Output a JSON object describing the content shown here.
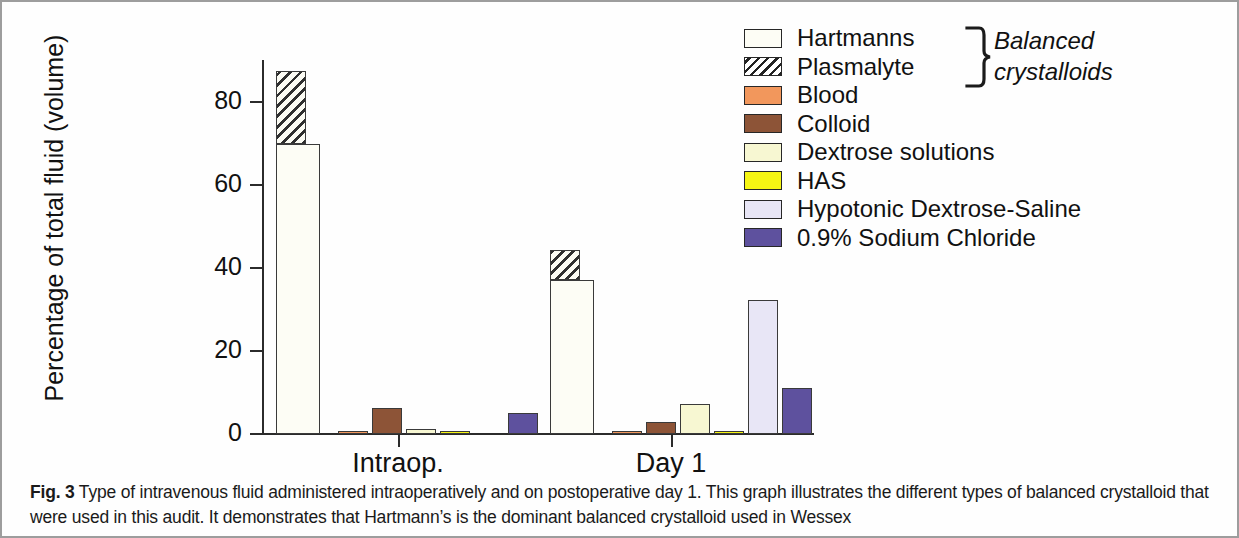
{
  "figure": {
    "caption_label": "Fig. 3",
    "caption_text": "Type of intravenous fluid administered intraoperatively and on postoperative day 1. This graph illustrates the different types of balanced crystalloid that were used in this audit. It demonstrates that Hartmann’s is the dominant balanced crystalloid used in Wessex"
  },
  "legend": {
    "annotation": "Balanced\ncrystalloids",
    "annotation_line1": "Balanced",
    "annotation_line2": "crystalloids",
    "items": [
      {
        "label": "Hartmanns",
        "color": "#fdfdf5",
        "pattern": "solid"
      },
      {
        "label": "Plasmalyte",
        "color": "#ffffff",
        "pattern": "hatch"
      },
      {
        "label": "Blood",
        "color": "#f2975c",
        "pattern": "solid"
      },
      {
        "label": "Colloid",
        "color": "#8d5437",
        "pattern": "solid"
      },
      {
        "label": "Dextrose solutions",
        "color": "#f7f7d2",
        "pattern": "solid"
      },
      {
        "label": "HAS",
        "color": "#f6f613",
        "pattern": "solid"
      },
      {
        "label": "Hypotonic Dextrose-Saline",
        "color": "#e8e6f6",
        "pattern": "solid"
      },
      {
        "label": "0.9% Sodium Chloride",
        "color": "#5e519e",
        "pattern": "solid"
      }
    ]
  },
  "chart_data": {
    "type": "bar",
    "title": "",
    "xlabel": "",
    "ylabel": "Percentage of total fluid (volume)",
    "categories": [
      "Intraop.",
      "Day 1"
    ],
    "ylim": [
      0,
      90
    ],
    "yticks": [
      0,
      20,
      40,
      60,
      80
    ],
    "ytick_labels": [
      "0",
      "20",
      "40",
      "60",
      "80"
    ],
    "grid": false,
    "legend_position": "right",
    "stacked_first_bar": true,
    "series": [
      {
        "name": "Hartmanns",
        "values": [
          70.0,
          37.0
        ]
      },
      {
        "name": "Plasmalyte",
        "values": [
          17.5,
          7.3
        ]
      },
      {
        "name": "Blood",
        "values": [
          0.3,
          0.4
        ]
      },
      {
        "name": "Colloid",
        "values": [
          6.2,
          2.9
        ]
      },
      {
        "name": "Dextrose solutions",
        "values": [
          1.3,
          7.3
        ]
      },
      {
        "name": "HAS",
        "values": [
          0.4,
          0.6
        ]
      },
      {
        "name": "Hypotonic Dextrose-Saline",
        "values": [
          0.0,
          32.3
        ]
      },
      {
        "name": "0.9% Sodium Chloride",
        "values": [
          5.1,
          11.0
        ]
      }
    ]
  },
  "axis": {
    "ticks": [
      {
        "label": "80"
      },
      {
        "label": "60"
      },
      {
        "label": "40"
      },
      {
        "label": "20"
      },
      {
        "label": "0"
      }
    ]
  }
}
